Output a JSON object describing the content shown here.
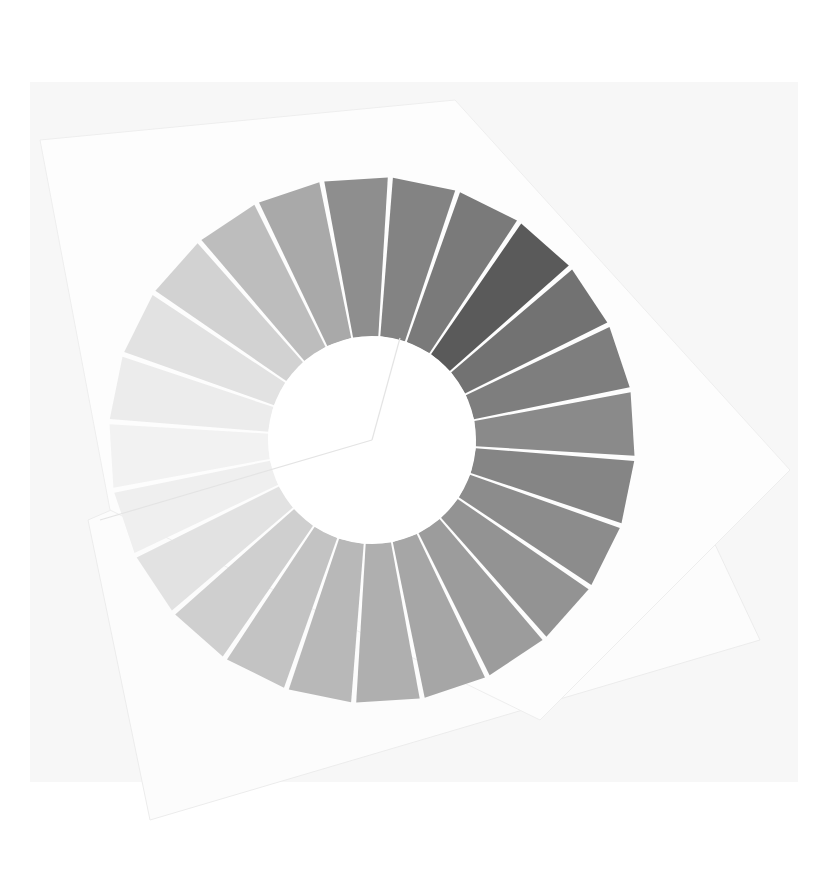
{
  "scene": {
    "description": "Photograph of a paper grayscale wheel: 24 trapezoidal gray paper strips arranged in a ring around a white circular center, mounted on overlapping white paper sheets",
    "background_color": "#ffffff",
    "backdrop_color": "#f7f7f7",
    "sheet_color": "#fdfdfd",
    "center_color": "#ffffff",
    "gap_color": "#ffffff"
  },
  "wheel": {
    "center": [
      372,
      440
    ],
    "outer_radius": 263,
    "inner_radius": 104,
    "segment_count": 24,
    "start_angle_deg": -101,
    "segments": [
      {
        "color": "#8e8e8e"
      },
      {
        "color": "#838383"
      },
      {
        "color": "#7a7a7a"
      },
      {
        "color": "#5a5a5a"
      },
      {
        "color": "#727272"
      },
      {
        "color": "#7e7e7e"
      },
      {
        "color": "#8a8a8a"
      },
      {
        "color": "#858585"
      },
      {
        "color": "#8c8c8c"
      },
      {
        "color": "#939393"
      },
      {
        "color": "#9c9c9c"
      },
      {
        "color": "#a6a6a6"
      },
      {
        "color": "#afafaf"
      },
      {
        "color": "#b8b8b8"
      },
      {
        "color": "#c3c3c3"
      },
      {
        "color": "#cfcfcf"
      },
      {
        "color": "#e2e2e2"
      },
      {
        "color": "#efefef"
      },
      {
        "color": "#f2f2f2"
      },
      {
        "color": "#ececec"
      },
      {
        "color": "#e2e2e2"
      },
      {
        "color": "#d2d2d2"
      },
      {
        "color": "#bdbdbd"
      },
      {
        "color": "#a9a9a9"
      }
    ]
  }
}
